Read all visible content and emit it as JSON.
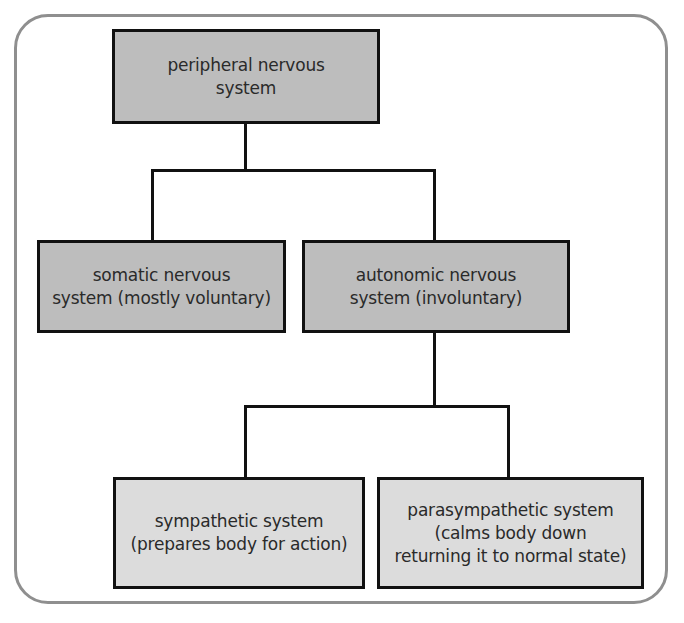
{
  "diagram": {
    "type": "hierarchy",
    "colors": {
      "frame_border": "#8f8f8f",
      "node_border": "#111111",
      "level_1_2_fill": "#bdbdbd",
      "level_3_fill": "#dcdcdc",
      "text": "#2a2a2a"
    },
    "nodes": {
      "peripheral": {
        "lines": [
          "peripheral nervous",
          "system"
        ]
      },
      "somatic": {
        "lines": [
          "somatic nervous",
          "system (mostly voluntary)"
        ]
      },
      "autonomic": {
        "lines": [
          "autonomic nervous",
          "system (involuntary)"
        ]
      },
      "sympathetic": {
        "lines": [
          "sympathetic system",
          "(prepares body for action)"
        ]
      },
      "parasympathetic": {
        "lines": [
          "parasympathetic system",
          "(calms body down",
          "returning it to normal state)"
        ]
      }
    },
    "edges": [
      {
        "from": "peripheral",
        "to": "somatic"
      },
      {
        "from": "peripheral",
        "to": "autonomic"
      },
      {
        "from": "autonomic",
        "to": "sympathetic"
      },
      {
        "from": "autonomic",
        "to": "parasympathetic"
      }
    ]
  }
}
